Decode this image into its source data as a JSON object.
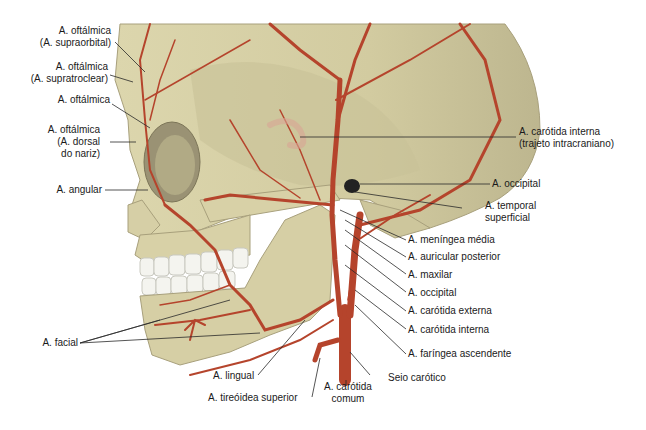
{
  "figure": {
    "colors": {
      "bone": "#d9d3a8",
      "bone_shadow": "#b7b08a",
      "artery": "#b5442c",
      "artery_dark": "#8e2f1c",
      "teeth": "#f4f4ef",
      "leader_line": "#2a2a2a"
    }
  },
  "labels_left": [
    {
      "id": "oftalmica-supraorbital",
      "lines": [
        "A. oftálmica",
        "(A. supraorbital)"
      ]
    },
    {
      "id": "oftalmica-supratroclear",
      "lines": [
        "A. oftálmica",
        "(A. supratroclear)"
      ]
    },
    {
      "id": "oftalmica",
      "lines": [
        "A. oftálmica"
      ]
    },
    {
      "id": "oftalmica-dorsal-nariz",
      "lines": [
        "A. oftálmica",
        "(A. dorsal",
        "do nariz)"
      ]
    },
    {
      "id": "angular",
      "lines": [
        "A. angular"
      ]
    },
    {
      "id": "facial",
      "lines": [
        "A. facial"
      ]
    }
  ],
  "labels_right": [
    {
      "id": "carotida-interna-intracraniano",
      "lines": [
        "A. carótida interna",
        "(trajeto intracraniano)"
      ]
    },
    {
      "id": "occipital-upper",
      "lines": [
        "A. occipital"
      ]
    },
    {
      "id": "temporal-superficial",
      "lines": [
        "A. temporal",
        "superficial"
      ]
    },
    {
      "id": "meningea-media",
      "lines": [
        "A. meníngea média"
      ]
    },
    {
      "id": "auricular-posterior",
      "lines": [
        "A. auricular posterior"
      ]
    },
    {
      "id": "maxilar",
      "lines": [
        "A. maxilar"
      ]
    },
    {
      "id": "occipital-lower",
      "lines": [
        "A. occipital"
      ]
    },
    {
      "id": "carotida-externa",
      "lines": [
        "A. carótida externa"
      ]
    },
    {
      "id": "carotida-interna",
      "lines": [
        "A. carótida interna"
      ]
    },
    {
      "id": "faringea-ascendente",
      "lines": [
        "A. faríngea ascendente"
      ]
    },
    {
      "id": "seio-carotico",
      "lines": [
        "Seio carótico"
      ]
    }
  ],
  "labels_bottom": [
    {
      "id": "lingual",
      "lines": [
        "A. lingual"
      ]
    },
    {
      "id": "tireoidea-superior",
      "lines": [
        "A. tireóidea superior"
      ]
    },
    {
      "id": "carotida-comum",
      "lines": [
        "A. carótida",
        "comum"
      ]
    }
  ]
}
